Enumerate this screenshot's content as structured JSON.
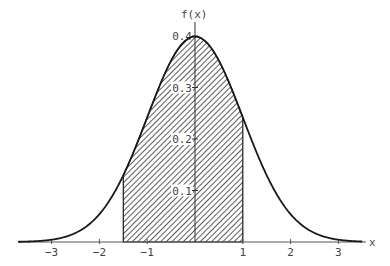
{
  "chart_data": {
    "type": "area",
    "title": "",
    "function": "standard normal density f(x) = (1/sqrt(2*pi)) * exp(-x^2/2)",
    "xlabel": "x",
    "ylabel": "f(x)",
    "xlim": [
      -3.7,
      3.5
    ],
    "ylim": [
      0,
      0.4
    ],
    "x_ticks": [
      -3,
      -2,
      -1,
      1,
      2,
      3
    ],
    "x_tick_labels": [
      "−3",
      "−2",
      "−1",
      "1",
      "2",
      "3"
    ],
    "y_ticks": [
      0.1,
      0.2,
      0.3,
      0.4
    ],
    "y_tick_labels": [
      "0.1",
      "0.2",
      "0.3",
      "0.4"
    ],
    "shaded_region": {
      "from": -1.5,
      "to": 1,
      "pattern": "diagonal hatch"
    },
    "grid": false,
    "legend": null,
    "colors": {
      "curve": "#1a1a1a",
      "axis": "#555555",
      "hatch": "#333333",
      "background": "#ffffff"
    }
  },
  "labels": {
    "x_axis": "x",
    "y_axis": "f(x)",
    "x_ticks": [
      "−3",
      "−2",
      "−1",
      "1",
      "2",
      "3"
    ],
    "y_ticks": [
      "0.1",
      "0.2",
      "0.3",
      "0.4"
    ]
  }
}
